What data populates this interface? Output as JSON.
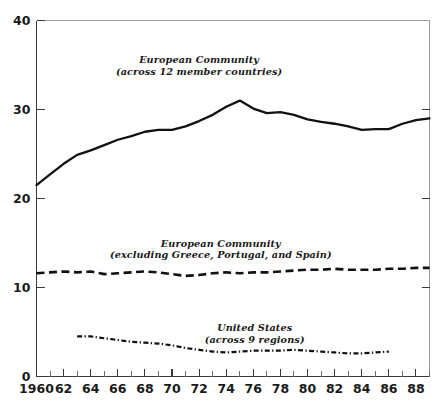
{
  "chart_data": {
    "type": "line",
    "title": "",
    "xlabel": "",
    "ylabel": "",
    "xlim": [
      1960,
      1989
    ],
    "ylim": [
      0,
      40
    ],
    "grid": false,
    "legend_position": "inline-annotations",
    "y_ticks": [
      0,
      10,
      20,
      30,
      40
    ],
    "y_tick_labels": [
      "0",
      "10",
      "20",
      "30",
      "40"
    ],
    "x_ticks": [
      1960,
      1962,
      1964,
      1966,
      1968,
      1970,
      1972,
      1974,
      1976,
      1978,
      1980,
      1982,
      1984,
      1986,
      1988
    ],
    "x_tick_labels": [
      "1960",
      "62",
      "64",
      "66",
      "68",
      "70",
      "72",
      "74",
      "76",
      "78",
      "80",
      "82",
      "84",
      "86",
      "88"
    ],
    "x_minor_ticks": [
      1961,
      1963,
      1965,
      1967,
      1969,
      1971,
      1973,
      1975,
      1977,
      1979,
      1981,
      1983,
      1985,
      1987,
      1989
    ],
    "series": [
      {
        "name": "European Community (across 12 member countries)",
        "style": "solid",
        "annotation_lines": [
          "European Community",
          "(across 12 member countries)"
        ],
        "annotation_x": 1972.0,
        "annotation_y": 35.2,
        "x": [
          1960,
          1961,
          1962,
          1963,
          1964,
          1965,
          1966,
          1967,
          1968,
          1969,
          1970,
          1971,
          1972,
          1973,
          1974,
          1975,
          1976,
          1977,
          1978,
          1979,
          1980,
          1981,
          1982,
          1983,
          1984,
          1985,
          1986,
          1987,
          1988,
          1989
        ],
        "y": [
          21.5,
          22.7,
          23.9,
          24.9,
          25.4,
          26.0,
          26.6,
          27.0,
          27.5,
          27.7,
          27.7,
          28.1,
          28.7,
          29.4,
          30.3,
          31.0,
          30.1,
          29.6,
          29.7,
          29.4,
          28.9,
          28.6,
          28.4,
          28.1,
          27.7,
          27.8,
          27.8,
          28.4,
          28.8,
          29.0
        ]
      },
      {
        "name": "European Community (excluding Greece, Portugal, and Spain)",
        "style": "dashed",
        "annotation_lines": [
          "European Community",
          "(excluding Greece, Portugal, and Spain)"
        ],
        "annotation_x": 1973.6,
        "annotation_y": 14.6,
        "x": [
          1960,
          1961,
          1962,
          1963,
          1964,
          1965,
          1966,
          1967,
          1968,
          1969,
          1970,
          1971,
          1972,
          1973,
          1974,
          1975,
          1976,
          1977,
          1978,
          1979,
          1980,
          1981,
          1982,
          1983,
          1984,
          1985,
          1986,
          1987,
          1988,
          1989
        ],
        "y": [
          11.6,
          11.7,
          11.8,
          11.7,
          11.8,
          11.5,
          11.6,
          11.7,
          11.8,
          11.7,
          11.5,
          11.3,
          11.4,
          11.6,
          11.7,
          11.6,
          11.7,
          11.7,
          11.8,
          11.9,
          12.0,
          12.0,
          12.1,
          12.0,
          12.0,
          12.0,
          12.1,
          12.1,
          12.2,
          12.2
        ]
      },
      {
        "name": "United States (across 9 regions)",
        "style": "dash-dot",
        "annotation_lines": [
          "United States",
          "(across 9 regions)"
        ],
        "annotation_x": 1976.1,
        "annotation_y": 5.1,
        "x": [
          1963,
          1964,
          1965,
          1966,
          1967,
          1968,
          1969,
          1970,
          1971,
          1972,
          1973,
          1974,
          1975,
          1976,
          1977,
          1978,
          1979,
          1980,
          1981,
          1982,
          1983,
          1984,
          1985,
          1986
        ],
        "y": [
          4.5,
          4.5,
          4.3,
          4.1,
          3.9,
          3.8,
          3.7,
          3.5,
          3.2,
          3.0,
          2.8,
          2.7,
          2.8,
          2.9,
          2.9,
          2.9,
          3.0,
          2.9,
          2.8,
          2.7,
          2.6,
          2.6,
          2.7,
          2.8
        ]
      }
    ]
  },
  "axes": {
    "y_axis_name": "value-axis",
    "x_axis_name": "year-axis"
  }
}
